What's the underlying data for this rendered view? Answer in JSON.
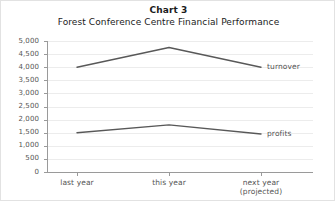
{
  "chart_data": {
    "type": "line",
    "title": "Chart 3",
    "subtitle": "Forest Conference Centre Financial Performance",
    "xlabel": "",
    "ylabel": "",
    "ylim": [
      0,
      5000
    ],
    "grid": true,
    "legend_position": "right-inline",
    "categories": [
      "last year",
      "this year",
      "next year (projected)"
    ],
    "x_tick_labels": [
      {
        "line1": "last year",
        "line2": ""
      },
      {
        "line1": "this year",
        "line2": ""
      },
      {
        "line1": "next year",
        "line2": "(projected)"
      }
    ],
    "y_ticks": [
      0,
      500,
      1000,
      1500,
      2000,
      2500,
      3000,
      3500,
      4000,
      4500,
      5000
    ],
    "y_tick_labels": [
      "0",
      "500",
      "1,000",
      "1,500",
      "2,000",
      "2,500",
      "3,000",
      "3,500",
      "4,000",
      "4,500",
      "5,000"
    ],
    "series": [
      {
        "name": "turnover",
        "values": [
          4000,
          4750,
          4000
        ],
        "color": "#585858"
      },
      {
        "name": "profits",
        "values": [
          1500,
          1800,
          1450
        ],
        "color": "#585858"
      }
    ]
  },
  "style": {
    "line_color": "#585858",
    "grid_color": "#ececec",
    "axis_color": "#9a9a9a",
    "text_color": "#555555",
    "title_color": "#1b1b1b",
    "background": "#ffffff",
    "border_color": "#e2e2e2"
  }
}
